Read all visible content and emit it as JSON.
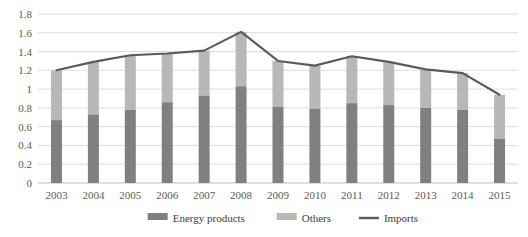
{
  "chart_data": {
    "type": "bar",
    "subtype": "stacked-bar-with-line",
    "title": "",
    "subtitle": "",
    "xlabel": "",
    "ylabel": "",
    "categories": [
      "2003",
      "2004",
      "2005",
      "2006",
      "2007",
      "2008",
      "2009",
      "2010",
      "2011",
      "2012",
      "2013",
      "2014",
      "2015"
    ],
    "ylim": [
      0,
      1.8
    ],
    "ytick_labels": [
      "0",
      "0.2",
      "0.4",
      "0.6",
      "0.8",
      "1",
      "1.2",
      "1.4",
      "1.6",
      "1.8"
    ],
    "ytick_values": [
      0,
      0.2,
      0.4,
      0.6,
      0.8,
      1,
      1.2,
      1.4,
      1.6,
      1.8
    ],
    "grid": true,
    "grid_axis": "y",
    "legend_position": "bottom",
    "series": [
      {
        "name": "Energy products",
        "type": "bar",
        "stack": "total",
        "color": "#808080",
        "values": [
          0.67,
          0.73,
          0.78,
          0.86,
          0.93,
          1.03,
          0.81,
          0.79,
          0.85,
          0.83,
          0.8,
          0.78,
          0.47
        ]
      },
      {
        "name": "Others",
        "type": "bar",
        "stack": "total",
        "color": "#b8b8b8",
        "values": [
          0.53,
          0.56,
          0.58,
          0.52,
          0.48,
          0.58,
          0.49,
          0.46,
          0.5,
          0.46,
          0.41,
          0.39,
          0.47
        ]
      },
      {
        "name": "Imports",
        "type": "line",
        "color": "#5a5a5a",
        "values": [
          1.2,
          1.29,
          1.36,
          1.38,
          1.41,
          1.61,
          1.3,
          1.25,
          1.35,
          1.29,
          1.21,
          1.17,
          0.94
        ]
      }
    ]
  },
  "legend": {
    "items": [
      {
        "label": "Energy products",
        "marker": "bar-swatch",
        "color": "#808080"
      },
      {
        "label": "Others",
        "marker": "bar-swatch",
        "color": "#b8b8b8"
      },
      {
        "label": "Imports",
        "marker": "line-swatch",
        "color": "#5a5a5a"
      }
    ]
  },
  "colors": {
    "energy_products": "#808080",
    "others": "#b8b8b8",
    "imports_line": "#5a5a5a",
    "gridline": "#d9d9d9",
    "axis_text": "#595959",
    "background": "#ffffff"
  }
}
